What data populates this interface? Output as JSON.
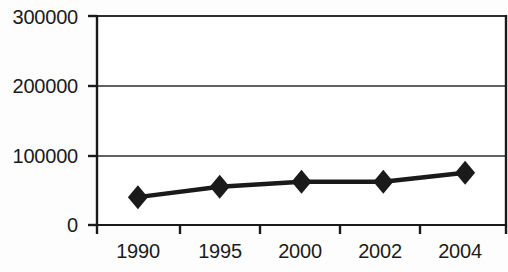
{
  "chart_data": {
    "type": "line",
    "title": "",
    "subtitle": "",
    "xlabel": "",
    "ylabel": "",
    "categories": [
      "1990",
      "1995",
      "2000",
      "2002",
      "2004"
    ],
    "values": [
      40000,
      55000,
      62000,
      62000,
      75000
    ],
    "series": [
      {
        "name": "",
        "values": [
          40000,
          55000,
          62000,
          62000,
          75000
        ]
      }
    ],
    "ylim": [
      0,
      300000
    ],
    "yticks": [
      0,
      100000,
      200000,
      300000
    ],
    "ytick_labels": [
      "0",
      "100000",
      "200000",
      "300000"
    ],
    "xtick_labels": [
      "1990",
      "1995",
      "2000",
      "2002",
      "2004"
    ],
    "grid": true,
    "grid_axis": "y",
    "legend": false,
    "legend_position": "none",
    "marker": "diamond",
    "line_color": "#1a1a1a",
    "marker_color": "#1a1a1a",
    "grid_color": "#333333",
    "axis_color": "#1a1a1a",
    "background_color": "#ffffff"
  }
}
